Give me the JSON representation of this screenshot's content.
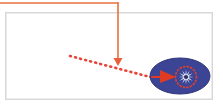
{
  "canvas": {
    "width": 223,
    "height": 109,
    "background": "#ffffff"
  },
  "panel": {
    "label": "diagram-panel",
    "x": 5,
    "y": 12,
    "width": 208,
    "height": 88,
    "fill": "#ffffff",
    "border_color": "#d8d8d8",
    "border_width": 1.5
  },
  "connector": {
    "label": "orange-elbow-connector",
    "color": "#e8713a",
    "stroke_width": 1.6,
    "horizontal": {
      "x1": 0,
      "y1": 3,
      "x2": 118,
      "y2": 3
    },
    "vertical": {
      "x1": 118,
      "y1": 3,
      "x2": 118,
      "y2": 58
    },
    "arrowhead": {
      "label": "down-arrowhead",
      "tip_x": 118,
      "tip_y": 66,
      "half_width": 4.5,
      "height": 8,
      "color": "#e8613a"
    }
  },
  "dotted_path": {
    "label": "red-dotted-trajectory",
    "color": "#e8443a",
    "stroke_width": 2.6,
    "dash": "1 4.2",
    "x1": 70,
    "y1": 56,
    "x2": 154,
    "y2": 78
  },
  "ellipse": {
    "label": "blue-region-ellipse",
    "cx": 180,
    "cy": 76,
    "rx": 30,
    "ry": 18,
    "fill": "#3b4495",
    "stroke": "#2f3578",
    "stroke_width": 1
  },
  "marker": {
    "label": "red-triangle-marker",
    "color": "#e03a22",
    "points": "160,70 176,77 160,83"
  },
  "starburst": {
    "label": "starburst-symbol",
    "cx": 186,
    "cy": 77,
    "outer_r": 7.5,
    "inner_r": 2.4,
    "points": 12,
    "color": "#e8eef6",
    "core_color": "#2a2f66",
    "core_r": 2.1
  },
  "dotted_ring": {
    "label": "red-dotted-ring",
    "cx": 186,
    "cy": 77,
    "r": 10.5,
    "color": "#d8402f",
    "stroke_width": 1.8,
    "dash": "1 2.6"
  },
  "legend": {
    "connector_name": "orange-elbow-connector",
    "path_name": "red-dotted-trajectory",
    "region_name": "blue-region-ellipse",
    "marker_name": "red-triangle-marker",
    "burst_name": "starburst-symbol"
  }
}
